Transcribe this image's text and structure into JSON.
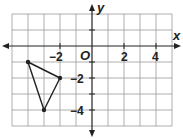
{
  "diagram": {
    "type": "coordinate-plane",
    "x_axis_label": "x",
    "y_axis_label": "y",
    "origin_label": "O",
    "x_range": [
      -5,
      5
    ],
    "y_range": [
      -5,
      2
    ],
    "grid_step": 1,
    "x_tick_labels": [
      {
        "value": -2,
        "text": "−2"
      },
      {
        "value": 2,
        "text": "2"
      },
      {
        "value": 4,
        "text": "4"
      }
    ],
    "y_tick_labels": [
      {
        "value": -2,
        "text": "−2"
      },
      {
        "value": -4,
        "text": "−4"
      }
    ],
    "triangle": {
      "vertices": [
        {
          "x": -4,
          "y": -1
        },
        {
          "x": -2,
          "y": -2
        },
        {
          "x": -3,
          "y": -4
        }
      ]
    },
    "colors": {
      "grid": "#9a9a9a",
      "axis": "#222222",
      "shape": "#222222",
      "background": "#ffffff"
    }
  }
}
